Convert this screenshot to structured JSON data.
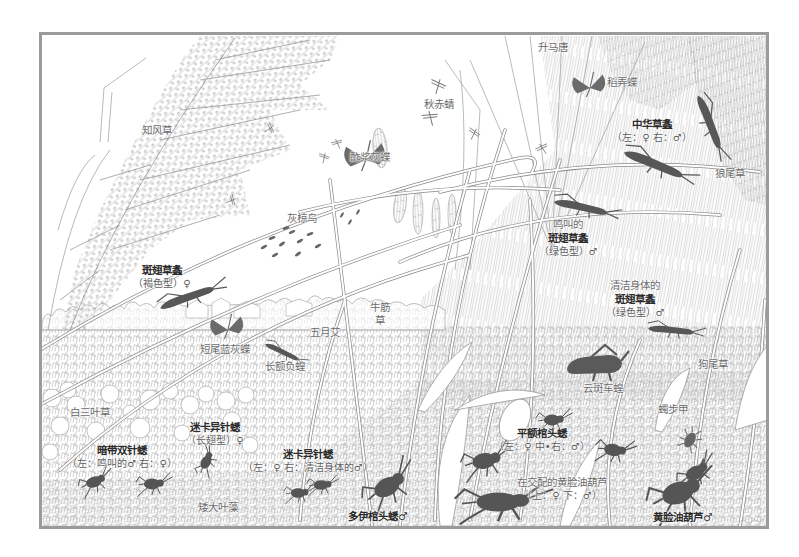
{
  "scene": {
    "plants": [
      {
        "name": "知风草"
      },
      {
        "name": "升马唐"
      },
      {
        "name": "狼尾草"
      },
      {
        "name": "牛筋草"
      },
      {
        "name": "五月艾"
      },
      {
        "name": "狗尾草"
      },
      {
        "name": "白三叶草"
      },
      {
        "name": "矮大叶藻"
      }
    ],
    "birds": [
      {
        "name": "灰椋鸟"
      }
    ],
    "insects": [
      {
        "name": "秋赤蜻"
      },
      {
        "name": "稻弄蝶"
      },
      {
        "name": "中华草螽",
        "note": "（左：♀ 右：♂）"
      },
      {
        "name": "酢浆灰蝶"
      },
      {
        "pre": "鸣叫的",
        "name": "斑翅草螽",
        "note": "（绿色型）♂"
      },
      {
        "pre": "清洁身体的",
        "name": "斑翅草螽",
        "note": "（绿色型）♂"
      },
      {
        "name": "斑翅草螽",
        "note": "（褐色型）♀"
      },
      {
        "name": "短尾蓝灰蝶"
      },
      {
        "name": "长额负蝗"
      },
      {
        "name": "云斑车蝗"
      },
      {
        "name": "迷卡异针蟋",
        "note": "（长翅型）♀"
      },
      {
        "name": "暗带双针蟋",
        "note": "（左：鸣叫的♂ 右：♀）"
      },
      {
        "name": "迷卡异针蟋",
        "note": "（左：♀ 右：清洁身体的♂）"
      },
      {
        "name": "平额棺头蟋",
        "note": "（左：♀ 中•右：♂）"
      },
      {
        "name": "蠋步甲"
      },
      {
        "name": "在交配的黄脸油葫芦",
        "note": "（上：♀ 下：♂）"
      },
      {
        "name": "多伊棺头蟋♂"
      },
      {
        "name": "黄脸油葫芦♂"
      }
    ]
  },
  "palette": {
    "frame": "#9b9b9b",
    "silhouette": "#575757",
    "line_art": "#9a9a9a",
    "background": "#ffffff"
  }
}
